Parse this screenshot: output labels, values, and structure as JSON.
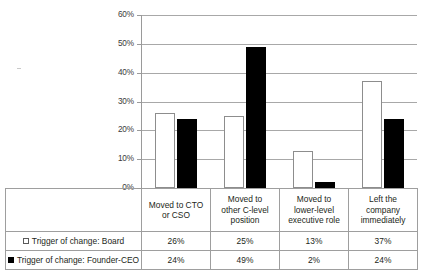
{
  "chart_data": {
    "type": "bar",
    "title": "",
    "subtitle": "",
    "xlabel": "",
    "ylabel": "",
    "ylim": [
      0,
      60
    ],
    "y_ticks": [
      "0%",
      "10%",
      "20%",
      "30%",
      "40%",
      "50%",
      "60%"
    ],
    "y_tick_values": [
      0,
      10,
      20,
      30,
      40,
      50,
      60
    ],
    "grid": true,
    "legend_position": "table-below",
    "categories": [
      "Moved to CTO or CSO",
      "Moved to other C-level position",
      "Moved to lower-level executive role",
      "Left the company immediately"
    ],
    "series": [
      {
        "name": "Trigger of change: Board",
        "values": [
          26,
          25,
          13,
          37
        ],
        "labels": [
          "26%",
          "25%",
          "13%",
          "37%"
        ],
        "color": "#ffffff",
        "edge_color": "#8d8d8d",
        "marker": "white-square"
      },
      {
        "name": "Trigger of change: Founder-CEO",
        "values": [
          24,
          49,
          2,
          24
        ],
        "labels": [
          "24%",
          "49%",
          "2%",
          "24%"
        ],
        "color": "#000000",
        "edge_color": "#000000",
        "marker": "black-square"
      }
    ]
  },
  "category_lines": [
    [
      "Moved to CTO",
      "or CSO"
    ],
    [
      "Moved to",
      "other C-level",
      "position"
    ],
    [
      "Moved to",
      "lower-level",
      "executive role"
    ],
    [
      "Left the",
      "company",
      "immediately"
    ]
  ],
  "colors": {
    "series_board": "#ffffff",
    "series_founder": "#000000",
    "gridline": "#a8a8a8",
    "axis": "#9a9a9a",
    "table_border": "#9e9e9e",
    "text": "#231f20",
    "background": "#ffffff"
  }
}
